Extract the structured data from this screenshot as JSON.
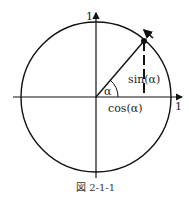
{
  "figure": {
    "caption": "図 2-1-1",
    "labels": {
      "y_axis_one": "1",
      "x_axis_one": "1",
      "angle": "α",
      "sin": "sin(α)",
      "cos": "cos(α)"
    },
    "colors": {
      "stroke": "#111111",
      "text": "#222222"
    }
  }
}
